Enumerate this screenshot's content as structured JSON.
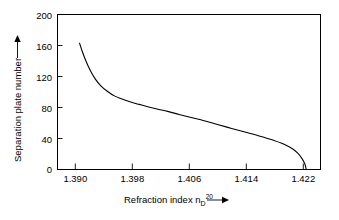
{
  "chart_data": {
    "type": "line",
    "title": "",
    "xlabel": "Refraction index n_D^20",
    "xlabel_main": "Refraction index n",
    "xlabel_sub": "D",
    "xlabel_sup": "20",
    "ylabel": "Separation plate number",
    "xlim": [
      1.3875,
      1.4245
    ],
    "ylim": [
      0,
      200
    ],
    "xticks": [
      1.39,
      1.398,
      1.406,
      1.414,
      1.422
    ],
    "xtick_labels": [
      "1.390",
      "1.398",
      "1.406",
      "1.414",
      "1.422"
    ],
    "yticks": [
      0,
      40,
      80,
      120,
      160,
      200
    ],
    "ytick_labels": [
      "0",
      "40",
      "80",
      "120",
      "160",
      "200"
    ],
    "grid": false,
    "legend": "none",
    "x_arrow": true,
    "y_arrow": true,
    "series": [
      {
        "name": "separation curve",
        "x": [
          1.3906,
          1.391,
          1.3915,
          1.3921,
          1.3928,
          1.3936,
          1.3945,
          1.3955,
          1.3966,
          1.3978,
          1.399,
          1.4002,
          1.4015,
          1.403,
          1.4046,
          1.4063,
          1.4081,
          1.41,
          1.412,
          1.414,
          1.416,
          1.4178,
          1.4193,
          1.4205,
          1.4213,
          1.4219,
          1.4223,
          1.4225
        ],
        "y": [
          163,
          152,
          140,
          128,
          117,
          108,
          101,
          95,
          91,
          87,
          84,
          81,
          78,
          75,
          71,
          67,
          63,
          58,
          53,
          48,
          43,
          38,
          33,
          27,
          21,
          14,
          7,
          0
        ]
      }
    ],
    "colors": {
      "curve": "#000000",
      "axis": "#000000",
      "background": "#ffffff",
      "text": "#000000"
    }
  }
}
